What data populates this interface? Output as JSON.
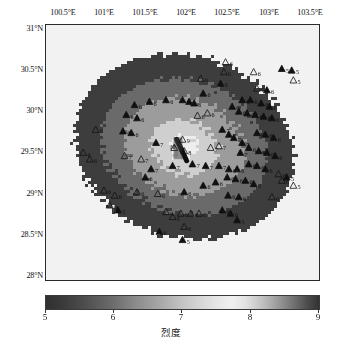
{
  "figure": {
    "kind": "seismic-intensity-map",
    "background": "#ffffff"
  },
  "axes": {
    "x_label_unit": "°E",
    "y_label_unit": "°N",
    "x_ticks": [
      "100.5°E",
      "101°E",
      "101.5°E",
      "102°E",
      "102.5°E",
      "103°E",
      "103.5°E"
    ],
    "x_values": [
      100.5,
      101,
      101.5,
      102,
      102.5,
      103,
      103.5
    ],
    "y_ticks": [
      "31°N",
      "30.5°N",
      "30°N",
      "29.5°N",
      "29°N",
      "28.5°N",
      "28°N"
    ],
    "y_values": [
      31,
      30.5,
      30,
      29.5,
      29,
      28.5,
      28
    ],
    "xlim": [
      100.35,
      103.65
    ],
    "ylim": [
      27.95,
      31.05
    ]
  },
  "colorbar": {
    "title": "烈度",
    "ticks": [
      "5",
      "6",
      "7",
      "8",
      "9"
    ],
    "values": [
      5,
      6,
      7,
      8,
      9
    ],
    "min": 5,
    "max": 9,
    "orientation": "horizontal",
    "colors": {
      "low": "#303030",
      "mid": "#a8a8a8",
      "peak": "#f0f0f0",
      "high": "#333333"
    }
  },
  "chart_data": {
    "type": "heatmap",
    "title": "",
    "xlabel": "",
    "ylabel": "",
    "clabel": "烈度",
    "xlim": [
      100.35,
      103.65
    ],
    "ylim": [
      27.95,
      31.05
    ],
    "clim": [
      5,
      9
    ],
    "grid": false,
    "legend": "none",
    "epicenter": {
      "lon": 102.0,
      "lat": 29.55,
      "label": "10"
    },
    "fault_trace": [
      {
        "lon": 101.93,
        "lat": 29.66
      },
      {
        "lon": 102.05,
        "lat": 29.4
      }
    ],
    "intensity_rings": [
      {
        "level": 9,
        "semi_major_deg": 0.17,
        "semi_minor_deg": 0.13,
        "shade": "#ededed"
      },
      {
        "level": 8,
        "semi_major_deg": 0.42,
        "semi_minor_deg": 0.33,
        "shade": "#cfcfcf"
      },
      {
        "level": 7,
        "semi_major_deg": 0.74,
        "semi_minor_deg": 0.58,
        "shade": "#9c9c9c"
      },
      {
        "level": 6,
        "semi_major_deg": 1.02,
        "semi_minor_deg": 0.8,
        "shade": "#6a6a6a"
      },
      {
        "level": 5,
        "semi_major_deg": 1.35,
        "semi_minor_deg": 1.1,
        "shade": "#3d3d3d"
      }
    ],
    "outside_value": 4.6,
    "stations": [
      {
        "lon": 102.52,
        "lat": 30.6,
        "label": "6",
        "filled": false
      },
      {
        "lon": 102.5,
        "lat": 30.48,
        "label": "6",
        "filled": false
      },
      {
        "lon": 102.86,
        "lat": 30.48,
        "label": "6",
        "filled": false
      },
      {
        "lon": 103.2,
        "lat": 30.52,
        "label": "5",
        "filled": true
      },
      {
        "lon": 103.32,
        "lat": 30.5,
        "label": "5",
        "filled": true
      },
      {
        "lon": 103.34,
        "lat": 30.38,
        "label": "5",
        "filled": false
      },
      {
        "lon": 102.9,
        "lat": 30.28,
        "label": "6",
        "filled": false
      },
      {
        "lon": 103.02,
        "lat": 30.26,
        "label": "6",
        "filled": true
      },
      {
        "lon": 102.25,
        "lat": 30.22,
        "label": "6",
        "filled": true
      },
      {
        "lon": 101.6,
        "lat": 30.12,
        "label": "6",
        "filled": true
      },
      {
        "lon": 101.8,
        "lat": 30.14,
        "label": "6",
        "filled": true
      },
      {
        "lon": 102.0,
        "lat": 30.14,
        "label": "6",
        "filled": true
      },
      {
        "lon": 102.08,
        "lat": 30.12,
        "label": "6",
        "filled": true
      },
      {
        "lon": 102.14,
        "lat": 30.1,
        "label": "6",
        "filled": true
      },
      {
        "lon": 101.42,
        "lat": 30.08,
        "label": "6",
        "filled": true
      },
      {
        "lon": 102.72,
        "lat": 30.14,
        "label": "6",
        "filled": true
      },
      {
        "lon": 102.82,
        "lat": 30.14,
        "label": "6",
        "filled": true
      },
      {
        "lon": 102.95,
        "lat": 30.1,
        "label": "6",
        "filled": true
      },
      {
        "lon": 103.05,
        "lat": 30.06,
        "label": "6",
        "filled": true
      },
      {
        "lon": 102.6,
        "lat": 30.06,
        "label": "6",
        "filled": true
      },
      {
        "lon": 102.68,
        "lat": 30.0,
        "label": "6",
        "filled": true
      },
      {
        "lon": 102.78,
        "lat": 29.98,
        "label": "6",
        "filled": true
      },
      {
        "lon": 102.88,
        "lat": 29.96,
        "label": "6",
        "filled": true
      },
      {
        "lon": 102.98,
        "lat": 29.94,
        "label": "6",
        "filled": true
      },
      {
        "lon": 103.08,
        "lat": 29.92,
        "label": "6",
        "filled": true
      },
      {
        "lon": 101.32,
        "lat": 29.96,
        "label": "6",
        "filled": true
      },
      {
        "lon": 101.45,
        "lat": 29.92,
        "label": "6",
        "filled": true
      },
      {
        "lon": 102.3,
        "lat": 29.98,
        "label": "6",
        "filled": false
      },
      {
        "lon": 102.18,
        "lat": 29.95,
        "label": "6",
        "filled": false
      },
      {
        "lon": 100.95,
        "lat": 29.78,
        "label": "6",
        "filled": false
      },
      {
        "lon": 101.28,
        "lat": 29.76,
        "label": "6",
        "filled": true
      },
      {
        "lon": 101.38,
        "lat": 29.74,
        "label": "6",
        "filled": true
      },
      {
        "lon": 102.48,
        "lat": 29.78,
        "label": "7",
        "filled": true
      },
      {
        "lon": 102.56,
        "lat": 29.72,
        "label": "7",
        "filled": true
      },
      {
        "lon": 102.62,
        "lat": 29.68,
        "label": "7",
        "filled": true
      },
      {
        "lon": 102.9,
        "lat": 29.74,
        "label": "6",
        "filled": true
      },
      {
        "lon": 103.0,
        "lat": 29.72,
        "label": "6",
        "filled": true
      },
      {
        "lon": 103.1,
        "lat": 29.68,
        "label": "6",
        "filled": true
      },
      {
        "lon": 102.72,
        "lat": 29.62,
        "label": "7",
        "filled": true
      },
      {
        "lon": 102.44,
        "lat": 29.58,
        "label": "7",
        "filled": false
      },
      {
        "lon": 102.34,
        "lat": 29.56,
        "label": "7",
        "filled": false
      },
      {
        "lon": 100.8,
        "lat": 29.5,
        "label": "6",
        "filled": false
      },
      {
        "lon": 100.88,
        "lat": 29.42,
        "label": "6",
        "filled": false
      },
      {
        "lon": 101.3,
        "lat": 29.46,
        "label": "7",
        "filled": false
      },
      {
        "lon": 101.5,
        "lat": 29.42,
        "label": "7",
        "filled": false
      },
      {
        "lon": 102.02,
        "lat": 29.52,
        "label": "8",
        "filled": false
      },
      {
        "lon": 101.9,
        "lat": 29.56,
        "label": "10",
        "filled": false
      },
      {
        "lon": 102.0,
        "lat": 29.66,
        "label": "9",
        "filled": false
      },
      {
        "lon": 101.88,
        "lat": 29.34,
        "label": "7",
        "filled": true
      },
      {
        "lon": 102.12,
        "lat": 29.36,
        "label": "7",
        "filled": true
      },
      {
        "lon": 102.28,
        "lat": 29.34,
        "label": "7",
        "filled": true
      },
      {
        "lon": 102.44,
        "lat": 29.34,
        "label": "7",
        "filled": true
      },
      {
        "lon": 102.56,
        "lat": 29.3,
        "label": "6",
        "filled": true
      },
      {
        "lon": 102.66,
        "lat": 29.3,
        "label": "6",
        "filled": true
      },
      {
        "lon": 102.8,
        "lat": 29.36,
        "label": "6",
        "filled": true
      },
      {
        "lon": 102.9,
        "lat": 29.34,
        "label": "6",
        "filled": true
      },
      {
        "lon": 103.0,
        "lat": 29.3,
        "label": "6",
        "filled": true
      },
      {
        "lon": 103.16,
        "lat": 29.24,
        "label": "6",
        "filled": false
      },
      {
        "lon": 103.2,
        "lat": 29.16,
        "label": "6",
        "filled": false
      },
      {
        "lon": 103.34,
        "lat": 29.1,
        "label": "5",
        "filled": false
      },
      {
        "lon": 103.26,
        "lat": 29.2,
        "label": "5",
        "filled": true
      },
      {
        "lon": 102.54,
        "lat": 29.2,
        "label": "6",
        "filled": true
      },
      {
        "lon": 102.64,
        "lat": 29.18,
        "label": "6",
        "filled": true
      },
      {
        "lon": 102.76,
        "lat": 29.16,
        "label": "6",
        "filled": true
      },
      {
        "lon": 102.86,
        "lat": 29.12,
        "label": "6",
        "filled": true
      },
      {
        "lon": 102.4,
        "lat": 29.14,
        "label": "6",
        "filled": true
      },
      {
        "lon": 102.25,
        "lat": 29.1,
        "label": "6",
        "filled": true
      },
      {
        "lon": 101.05,
        "lat": 29.04,
        "label": "6",
        "filled": false
      },
      {
        "lon": 101.18,
        "lat": 28.98,
        "label": "6",
        "filled": false
      },
      {
        "lon": 101.45,
        "lat": 29.02,
        "label": "6",
        "filled": false
      },
      {
        "lon": 101.7,
        "lat": 29.0,
        "label": "6",
        "filled": false
      },
      {
        "lon": 102.02,
        "lat": 29.02,
        "label": "6",
        "filled": true
      },
      {
        "lon": 102.55,
        "lat": 28.98,
        "label": "6",
        "filled": true
      },
      {
        "lon": 102.68,
        "lat": 28.96,
        "label": "6",
        "filled": true
      },
      {
        "lon": 103.08,
        "lat": 28.96,
        "label": "6",
        "filled": false
      },
      {
        "lon": 101.12,
        "lat": 28.86,
        "label": "6",
        "filled": false
      },
      {
        "lon": 101.22,
        "lat": 28.8,
        "label": "5",
        "filled": true
      },
      {
        "lon": 101.8,
        "lat": 28.78,
        "label": "6",
        "filled": false
      },
      {
        "lon": 101.88,
        "lat": 28.72,
        "label": "6",
        "filled": false
      },
      {
        "lon": 101.98,
        "lat": 28.76,
        "label": "6",
        "filled": false
      },
      {
        "lon": 102.1,
        "lat": 28.76,
        "label": "6",
        "filled": false
      },
      {
        "lon": 102.2,
        "lat": 28.76,
        "label": "6",
        "filled": false
      },
      {
        "lon": 102.48,
        "lat": 28.8,
        "label": "6",
        "filled": true
      },
      {
        "lon": 102.58,
        "lat": 28.76,
        "label": "6",
        "filled": true
      },
      {
        "lon": 102.66,
        "lat": 28.68,
        "label": "5",
        "filled": true
      },
      {
        "lon": 102.02,
        "lat": 28.6,
        "label": "6",
        "filled": false
      },
      {
        "lon": 101.72,
        "lat": 28.54,
        "label": "6",
        "filled": true
      },
      {
        "lon": 102.0,
        "lat": 28.44,
        "label": "5",
        "filled": true
      },
      {
        "lon": 102.46,
        "lat": 30.34,
        "label": "6",
        "filled": true
      },
      {
        "lon": 102.22,
        "lat": 30.4,
        "label": "6",
        "filled": false
      },
      {
        "lon": 101.68,
        "lat": 29.62,
        "label": "7",
        "filled": true
      },
      {
        "lon": 101.62,
        "lat": 29.3,
        "label": "7",
        "filled": true
      },
      {
        "lon": 101.55,
        "lat": 29.2,
        "label": "6",
        "filled": true
      },
      {
        "lon": 102.92,
        "lat": 29.52,
        "label": "6",
        "filled": true
      },
      {
        "lon": 103.02,
        "lat": 29.5,
        "label": "6",
        "filled": true
      },
      {
        "lon": 103.12,
        "lat": 29.46,
        "label": "6",
        "filled": true
      },
      {
        "lon": 102.8,
        "lat": 29.56,
        "label": "6",
        "filled": true
      },
      {
        "lon": 102.7,
        "lat": 29.5,
        "label": "7",
        "filled": true
      }
    ]
  }
}
